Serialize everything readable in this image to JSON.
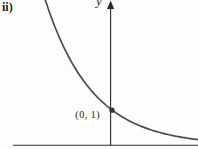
{
  "figure_label": "ii)",
  "axes": {
    "y_label": "y",
    "x_label": ""
  },
  "point_label": "(0, 1)",
  "chart_data": {
    "type": "line",
    "title": "",
    "xlabel": "",
    "ylabel": "y",
    "part_label": "ii)",
    "curve_description": "exponential decay curve, decreasing left-to-right, horizontal asymptote y = 0 (x-axis)",
    "marked_points": [
      {
        "label": "(0, 1)",
        "x": 0,
        "y": 1
      }
    ],
    "legend": "none",
    "grid": "off"
  },
  "colors": {
    "axis": "#2b2b2b",
    "curve": "#4d4d4d",
    "marker": "#333333",
    "text": "#1b1b1b",
    "background": "#fdfdfd"
  },
  "figure": {
    "width": 198,
    "height": 149,
    "x_axis": {
      "x1": 13,
      "x2": 198,
      "y": 145.3
    },
    "y_axis": {
      "x": 110.6,
      "y1": 2,
      "y2": 145.3
    },
    "arrowhead": {
      "apex_x": 110.6,
      "apex_y": 0.5,
      "base_y": 9,
      "half_width": 3.6
    },
    "curve_model": {
      "asymptote_y": 145.3,
      "amplitude": 35.3,
      "k": 0.02122,
      "x_ref": 112,
      "x_start": 44,
      "x_end": 198,
      "step": 2
    },
    "marker": {
      "x": 112,
      "y": 110.2,
      "r": 2.6
    }
  }
}
